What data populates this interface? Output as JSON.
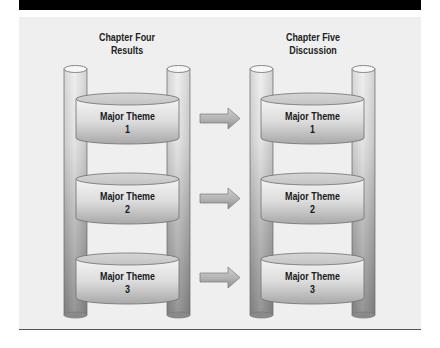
{
  "columns": [
    {
      "title_line1": "Chapter Four",
      "title_line2": "Results",
      "themes": [
        {
          "label": "Major Theme",
          "number": "1"
        },
        {
          "label": "Major Theme",
          "number": "2"
        },
        {
          "label": "Major Theme",
          "number": "3"
        }
      ]
    },
    {
      "title_line1": "Chapter Five",
      "title_line2": "Discussion",
      "themes": [
        {
          "label": "Major Theme",
          "number": "1"
        },
        {
          "label": "Major Theme",
          "number": "2"
        },
        {
          "label": "Major Theme",
          "number": "3"
        }
      ]
    }
  ],
  "arrows": [
    {
      "from": "Chapter Four Theme 1",
      "to": "Chapter Five Theme 1",
      "icon": "arrow-right-icon"
    },
    {
      "from": "Chapter Four Theme 2",
      "to": "Chapter Five Theme 2",
      "icon": "arrow-right-icon"
    },
    {
      "from": "Chapter Four Theme 3",
      "to": "Chapter Five Theme 3",
      "icon": "arrow-right-icon"
    }
  ],
  "colors": {
    "top_bar": "#000000",
    "panel_background": "#efefef",
    "pole_light": "#e4e4e4",
    "pole_dark": "#8f8f8f",
    "disk_light": "#f2f2f2",
    "disk_dark": "#b0b0b0",
    "outline": "#6e6e6e"
  }
}
